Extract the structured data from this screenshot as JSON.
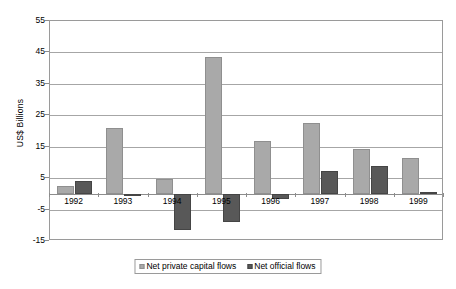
{
  "chart_data": {
    "type": "bar",
    "title": "",
    "subtitle": "",
    "xlabel": "",
    "ylabel": "US$ Billions",
    "categories": [
      "1992",
      "1993",
      "1994",
      "1995",
      "1996",
      "1997",
      "1998",
      "1999"
    ],
    "series": [
      {
        "name": "Net private capital flows",
        "color": "#a9a9a9",
        "values": [
          2.5,
          21.0,
          4.7,
          43.7,
          16.7,
          22.7,
          14.2,
          11.5
        ]
      },
      {
        "name": "Net official flows",
        "color": "#585858",
        "values": [
          4.0,
          -0.4,
          -11.5,
          -9.0,
          -1.5,
          7.3,
          8.8,
          0.5
        ]
      }
    ],
    "ylim": [
      -15,
      55
    ],
    "yticks": [
      55,
      45,
      35,
      25,
      15,
      5,
      -5,
      -15
    ],
    "ytick_labels": [
      "55",
      "45",
      "35",
      "25",
      "15",
      "5",
      "-5",
      "-15"
    ],
    "grid": true,
    "legend_position": "bottom"
  },
  "legend": {
    "items": [
      {
        "label": "Net private capital flows",
        "swatch": "legend-swatch-private"
      },
      {
        "label": "Net official flows",
        "swatch": "legend-swatch-official"
      }
    ]
  }
}
